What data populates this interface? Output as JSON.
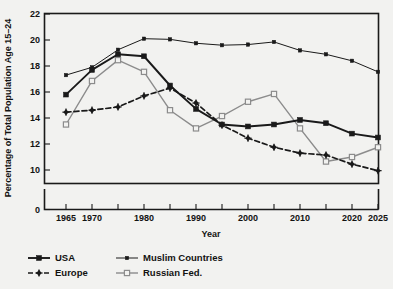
{
  "chart_data": {
    "type": "line",
    "title": "",
    "xlabel": "Year",
    "ylabel": "Percentage of Total Population Age 15–24",
    "xlim": [
      1965,
      2025
    ],
    "ylim": [
      10,
      22
    ],
    "y_axis_broken_to_zero": true,
    "grid": false,
    "legend_position": "bottom-left",
    "x": [
      1965,
      1970,
      1975,
      1980,
      1985,
      1990,
      1995,
      2000,
      2005,
      2010,
      2015,
      2020,
      2025
    ],
    "x_tick_values": [
      1965,
      1970,
      1975,
      1980,
      1985,
      1990,
      1995,
      2000,
      2005,
      2010,
      2015,
      2020,
      2025
    ],
    "x_tick_labels": [
      "1965",
      "1970",
      "",
      "1980",
      "",
      "1990",
      "",
      "2000",
      "",
      "2010",
      "",
      "2020",
      "2025"
    ],
    "y_tick_values": [
      0,
      10,
      12,
      14,
      16,
      18,
      20,
      22
    ],
    "y_tick_labels": [
      "0",
      "10",
      "12",
      "14",
      "16",
      "18",
      "20",
      "22"
    ],
    "series": [
      {
        "name": "USA",
        "color": "#1a1a1a",
        "marker": "filled-square",
        "dash": "solid",
        "width": 1.9,
        "values": [
          15.8,
          17.7,
          18.9,
          18.75,
          16.5,
          14.7,
          13.5,
          13.35,
          13.5,
          13.85,
          13.6,
          12.8,
          12.5
        ]
      },
      {
        "name": "Europe",
        "color": "#1a1a1a",
        "marker": "plus-diamond",
        "dash": "dashed",
        "width": 1.7,
        "values": [
          14.45,
          14.6,
          14.85,
          15.7,
          16.3,
          15.15,
          13.45,
          12.45,
          11.75,
          11.3,
          11.15,
          10.45,
          9.95
        ]
      },
      {
        "name": "Muslim Countries",
        "color": "#1a1a1a",
        "marker": "small-filled",
        "dash": "solid",
        "width": 1.0,
        "values": [
          17.3,
          17.9,
          19.25,
          20.1,
          20.05,
          19.75,
          19.6,
          19.65,
          19.85,
          19.2,
          18.9,
          18.4,
          17.55
        ]
      },
      {
        "name": "Russian Fed.",
        "color": "#8c8c8c",
        "marker": "open-square",
        "dash": "solid",
        "width": 1.4,
        "values": [
          13.5,
          16.85,
          18.45,
          17.55,
          14.6,
          13.2,
          14.15,
          15.25,
          15.85,
          13.2,
          10.65,
          11.0,
          11.75
        ]
      }
    ]
  },
  "legend": {
    "entries": [
      {
        "label": "USA"
      },
      {
        "label": "Muslim Countries"
      },
      {
        "label": "Europe"
      },
      {
        "label": "Russian Fed."
      }
    ]
  },
  "colors": {
    "background": "#f2f2f0",
    "axis": "#1a1a1a",
    "gray_series": "#8c8c8c"
  }
}
